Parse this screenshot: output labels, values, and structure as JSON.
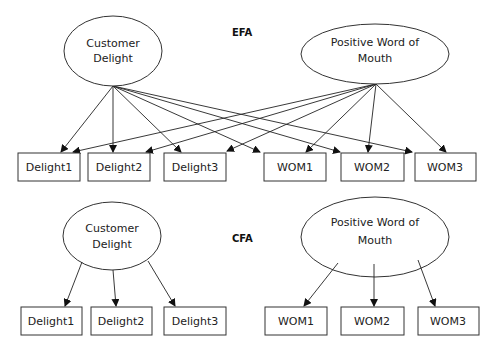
{
  "efa": {
    "title": "EFA",
    "factors": [
      {
        "id": "cd",
        "line1": "Customer",
        "line2": "Delight"
      },
      {
        "id": "pwom",
        "line1": "Positive Word of",
        "line2": "Mouth"
      }
    ],
    "indicators": [
      "Delight1",
      "Delight2",
      "Delight3",
      "WOM1",
      "WOM2",
      "WOM3"
    ],
    "note": "Each factor loads on all six indicators"
  },
  "cfa": {
    "title": "CFA",
    "factors": [
      {
        "id": "cd",
        "line1": "Customer",
        "line2": "Delight"
      },
      {
        "id": "pwom",
        "line1": "Positive Word of",
        "line2": "Mouth"
      }
    ],
    "indicators": [
      "Delight1",
      "Delight2",
      "Delight3",
      "WOM1",
      "WOM2",
      "WOM3"
    ],
    "note": "Customer Delight loads on Delight1-3; Positive Word of Mouth loads on WOM1-3"
  },
  "colors": {
    "stroke": "#333333",
    "text": "#222222",
    "background": "#ffffff"
  }
}
